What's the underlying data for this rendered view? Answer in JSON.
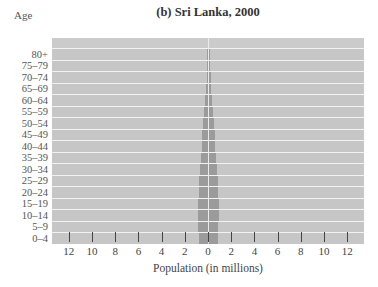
{
  "chart_data": {
    "type": "bar",
    "subtype": "population-pyramid",
    "title": "(b) Sri Lanka, 2000",
    "ylabel": "Age",
    "xlabel": "Population (in millions)",
    "legend": [
      "Males",
      "Females"
    ],
    "categories": [
      "80+",
      "75–79",
      "70–74",
      "65–69",
      "60–64",
      "55–59",
      "50–54",
      "45–49",
      "40–44",
      "35–39",
      "30–34",
      "25–29",
      "20–24",
      "15–19",
      "10–14",
      "5–9",
      "0–4"
    ],
    "x_ticks": [
      "12",
      "10",
      "8",
      "6",
      "4",
      "2",
      "0",
      "2",
      "4",
      "6",
      "8",
      "10",
      "12"
    ],
    "xlim": [
      -13,
      13
    ],
    "grid": true,
    "series": [
      {
        "name": "Males",
        "values": [
          0.05,
          0.08,
          0.12,
          0.2,
          0.25,
          0.32,
          0.4,
          0.48,
          0.55,
          0.6,
          0.68,
          0.75,
          0.8,
          0.85,
          0.85,
          0.82,
          0.8
        ]
      },
      {
        "name": "Females",
        "values": [
          0.06,
          0.09,
          0.13,
          0.21,
          0.26,
          0.33,
          0.41,
          0.49,
          0.56,
          0.61,
          0.68,
          0.74,
          0.79,
          0.83,
          0.83,
          0.8,
          0.78
        ]
      }
    ]
  },
  "labels": {
    "title": "(b) Sri Lanka, 2000",
    "age_header": "Age",
    "males": "Males",
    "females": "Females",
    "xlabel": "Population (in millions)"
  }
}
